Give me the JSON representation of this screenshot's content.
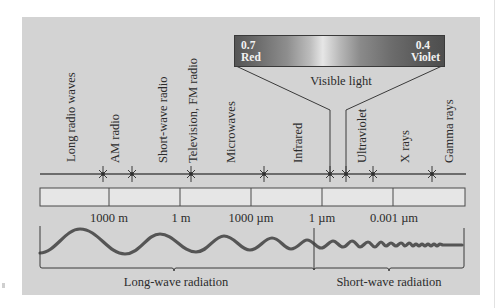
{
  "diagram": {
    "colors": {
      "panel_bg": "#d3d3d3",
      "line": "#4a4a4a",
      "wave": "#555555",
      "scale_fill": "#e6e6e6"
    },
    "bands": [
      {
        "label": "Long radio waves"
      },
      {
        "label": "AM radio"
      },
      {
        "label": "Short-wave radio"
      },
      {
        "label": "Television, FM radio"
      },
      {
        "label": "Microwaves"
      },
      {
        "label": "Infrared"
      },
      {
        "label": "Ultraviolet"
      },
      {
        "label": "X rays"
      },
      {
        "label": "Gamma rays"
      }
    ],
    "visible_light": {
      "label": "Visible light",
      "left_value": "0.7",
      "left_color": "Red",
      "right_value": "0.4",
      "right_color": "Violet"
    },
    "scale_ticks": [
      {
        "label": "1000 m"
      },
      {
        "label": "1 m"
      },
      {
        "label": "1000 µm"
      },
      {
        "label": "1 µm"
      },
      {
        "label": "0.001 µm"
      }
    ],
    "radiation_groups": [
      {
        "label": "Long-wave radiation"
      },
      {
        "label": "Short-wave radiation"
      }
    ]
  }
}
